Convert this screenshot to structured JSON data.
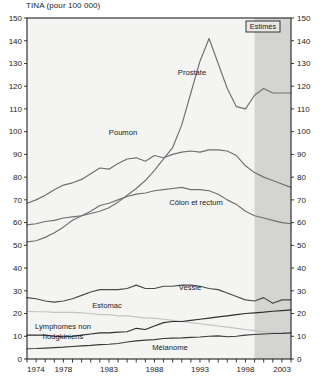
{
  "chart_data": {
    "type": "line",
    "title": "TINA (pour 100 000)",
    "xlabel": "",
    "ylabel": "",
    "xlim": [
      1974,
      2003
    ],
    "ylim": [
      0,
      150
    ],
    "ytick_step": 10,
    "yticks": [
      0,
      10,
      20,
      30,
      40,
      50,
      60,
      70,
      80,
      90,
      100,
      110,
      120,
      130,
      140,
      150
    ],
    "xticks_labeled": [
      1974,
      1978,
      1983,
      1988,
      1993,
      1998,
      2003
    ],
    "grid": false,
    "legend": "inline-labels",
    "annotation": {
      "text": "Estimés",
      "start_year": 1999,
      "end_year": 2003
    },
    "x": [
      1974,
      1975,
      1976,
      1977,
      1978,
      1979,
      1980,
      1981,
      1982,
      1983,
      1984,
      1985,
      1986,
      1987,
      1988,
      1989,
      1990,
      1991,
      1992,
      1993,
      1994,
      1995,
      1996,
      1997,
      1998,
      1999,
      2000,
      2001,
      2002,
      2003
    ],
    "series": [
      {
        "name": "Prostate",
        "color": "#6f6f6f",
        "values": [
          51.5,
          52,
          53.5,
          55.5,
          58,
          61,
          63,
          64,
          65,
          66.5,
          69,
          72,
          75,
          78.5,
          83,
          88,
          93,
          103,
          117,
          131,
          141,
          130,
          119,
          111,
          110,
          116,
          119,
          117,
          117,
          117
        ]
      },
      {
        "name": "Poumon",
        "color": "#6f6f6f",
        "values": [
          68.5,
          70,
          72,
          74.5,
          76.5,
          77.5,
          79,
          81.5,
          84,
          83.5,
          86,
          88,
          88.5,
          87,
          89.5,
          88.5,
          90,
          91,
          91.5,
          91,
          92,
          92,
          91.5,
          89.5,
          85,
          82,
          80,
          78.5,
          77,
          75.5
        ]
      },
      {
        "name": "Côlon et rectum",
        "color": "#6f6f6f",
        "values": [
          59,
          59.5,
          60.5,
          61,
          62,
          62.5,
          63,
          65,
          67.5,
          68.5,
          70,
          71.5,
          72.5,
          73,
          74,
          74.5,
          75,
          75.5,
          74.5,
          74.5,
          74,
          72.5,
          70,
          68,
          65,
          63,
          62,
          61,
          60,
          59.5
        ]
      },
      {
        "name": "Vessie",
        "color": "#4a4a4a",
        "values": [
          27,
          26.5,
          25.5,
          25,
          25.5,
          26.5,
          28,
          29.5,
          30.5,
          30.5,
          30.5,
          31,
          32.5,
          31,
          31,
          32,
          32,
          32.5,
          32.5,
          32,
          31,
          30.5,
          29,
          27.5,
          26,
          25.5,
          27,
          24.5,
          26,
          26
        ]
      },
      {
        "name": "Estomac",
        "color": "#c3c3c3",
        "values": [
          21,
          20.8,
          20.8,
          20.5,
          20.5,
          20.5,
          20.3,
          20,
          19.5,
          19.5,
          19,
          19,
          18.5,
          18,
          18,
          17.5,
          17,
          16.5,
          16,
          15.5,
          15,
          14.5,
          14,
          13.5,
          13,
          12.5,
          12,
          11.8,
          11.5,
          11.2
        ]
      },
      {
        "name": "Lymphomes non hodgkiniens",
        "color": "#2e2e2e",
        "values": [
          10.5,
          10.5,
          10.5,
          10,
          9.8,
          10,
          10.5,
          11,
          11.5,
          11.5,
          11.8,
          12,
          13.5,
          13,
          14.5,
          16,
          16.5,
          16.5,
          17,
          17.5,
          18,
          18.5,
          19,
          19.5,
          20,
          20.3,
          20.6,
          21,
          21.3,
          21.6
        ]
      },
      {
        "name": "Mélanome",
        "color": "#3a3a3a",
        "values": [
          4.5,
          4.6,
          4.8,
          5,
          5.2,
          5.5,
          5.8,
          6,
          6.3,
          6.5,
          6.8,
          7.5,
          8,
          8.3,
          8.5,
          9,
          9.2,
          9.3,
          9.5,
          9.7,
          10,
          10.2,
          9.8,
          10,
          10.5,
          10.8,
          11,
          11.2,
          11.3,
          11.5
        ]
      }
    ],
    "series_labels": [
      {
        "text": "Prostate",
        "x": 192,
        "y": 75
      },
      {
        "text": "Poumon",
        "x": 123,
        "y": 135
      },
      {
        "text": "Côlon et rectum",
        "x": 196,
        "y": 205
      },
      {
        "text": "Vessie",
        "x": 190,
        "y": 290
      },
      {
        "text": "Estomac",
        "x": 107,
        "y": 308
      },
      {
        "text": "Lymphomes non",
        "x": 63,
        "y": 329
      },
      {
        "text": "hodgkiniens",
        "x": 63,
        "y": 339
      },
      {
        "text": "Mélanome",
        "x": 170,
        "y": 350
      }
    ]
  }
}
